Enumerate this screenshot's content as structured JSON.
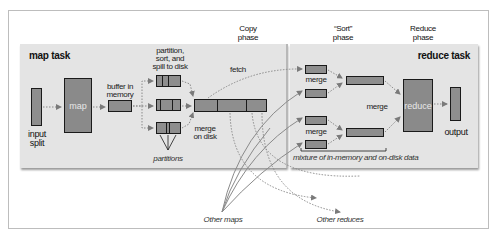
{
  "phases": {
    "copy": "Copy\nphase",
    "sort": "“Sort”\nphase",
    "reduce": "Reduce\nphase"
  },
  "map_task": {
    "title": "map task",
    "input_split_label": "input\nsplit",
    "map_label": "map",
    "buffer_label": "buffer in\nmemory",
    "spill_label": "partition,\nsort, and\nspill to disk",
    "partitions_label": "partitions",
    "merge_on_disk_label": "merge\non disk"
  },
  "copy": {
    "fetch_label": "fetch"
  },
  "reduce_task": {
    "title": "reduce task",
    "merge_top_label": "merge",
    "merge_mid_label": "merge",
    "merge_bottom_label": "merge",
    "reduce_label": "reduce",
    "output_label": "output",
    "mixture_label": "mixture of in-memory and on-disk data"
  },
  "external": {
    "other_maps": "Other maps",
    "other_reduces": "Other reduces"
  },
  "colors": {
    "panel": "#e4e4e4",
    "box": "#8e8e8e",
    "border": "#1a1a1a",
    "arrow": "#7a7a7a"
  }
}
